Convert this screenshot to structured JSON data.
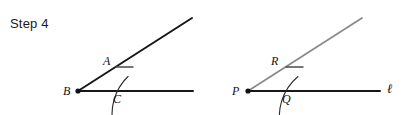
{
  "title": "Step 4",
  "canvas": {
    "width": 403,
    "height": 115,
    "background": "#ffffff"
  },
  "colors": {
    "dark_stroke": "#171717",
    "gray_stroke": "#8a8a8a",
    "arc_stroke": "#2b2b2b",
    "text": "#111111"
  },
  "figures": [
    {
      "id": "original-angle",
      "name": "original-angle-figure",
      "vertex": {
        "label": "B",
        "x": 78,
        "y": 91
      },
      "rays": [
        {
          "name": "slanted-ray",
          "from": [
            78,
            91
          ],
          "to": [
            192,
            18
          ],
          "color": "#171717",
          "width": 2.0
        },
        {
          "name": "horizontal-ray",
          "from": [
            78,
            91
          ],
          "to": [
            193,
            91
          ],
          "color": "#171717",
          "width": 2.0
        }
      ],
      "arc": {
        "name": "construction-arc",
        "center": [
          78,
          91
        ],
        "radius": 52,
        "start_angle_deg": -46,
        "end_angle_deg": 16,
        "color": "#2b2b2b",
        "width": 1.1
      },
      "intersection_points": [
        {
          "label": "A",
          "x": 114,
          "y": 68,
          "label_x": 105,
          "label_y": 63,
          "tick": true
        },
        {
          "label": "C",
          "x": 130,
          "y": 91,
          "label_x": 114,
          "label_y": 101,
          "tick": false
        }
      ],
      "tick_mark": {
        "name": "arrow-tick-A",
        "from": [
          116,
          67
        ],
        "to": [
          133,
          67
        ]
      }
    },
    {
      "id": "copied-angle",
      "name": "copied-angle-figure",
      "vertex": {
        "label": "P",
        "x": 248,
        "y": 91
      },
      "line_label": "ℓ",
      "line_label_pos": {
        "x": 388,
        "y": 92
      },
      "rays": [
        {
          "name": "slanted-ray",
          "from": [
            248,
            91
          ],
          "to": [
            362,
            18
          ],
          "color": "#8a8a8a",
          "width": 1.7
        },
        {
          "name": "horizontal-ray",
          "from": [
            248,
            91
          ],
          "to": [
            380,
            91
          ],
          "color": "#171717",
          "width": 2.0
        }
      ],
      "arc": {
        "name": "construction-arc",
        "center": [
          248,
          91
        ],
        "radius": 52,
        "start_angle_deg": -50,
        "end_angle_deg": 16,
        "color": "#2b2b2b",
        "width": 1.1
      },
      "intersection_points": [
        {
          "label": "R",
          "x": 284,
          "y": 68,
          "label_x": 272,
          "label_y": 63,
          "tick": true
        },
        {
          "label": "Q",
          "x": 300,
          "y": 91,
          "label_x": 283,
          "label_y": 101,
          "tick": false
        }
      ],
      "tick_mark": {
        "name": "arrow-tick-R",
        "from": [
          286,
          67
        ],
        "to": [
          303,
          67
        ]
      }
    }
  ]
}
